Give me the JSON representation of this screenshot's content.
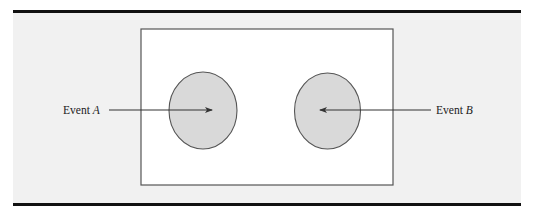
{
  "diagram": {
    "type": "venn",
    "colors": {
      "panel_background": "#f1f1f1",
      "sample_space_fill": "#ffffff",
      "sample_space_stroke": "#555555",
      "event_fill": "#d9d9d9",
      "event_stroke": "#555555",
      "arrow": "#333333",
      "rule": "#111111"
    },
    "events": [
      {
        "id": "A",
        "label_prefix": "Event ",
        "label_var": "A",
        "arrow_direction": "right"
      },
      {
        "id": "B",
        "label_prefix": "Event ",
        "label_var": "B",
        "arrow_direction": "left"
      }
    ]
  }
}
